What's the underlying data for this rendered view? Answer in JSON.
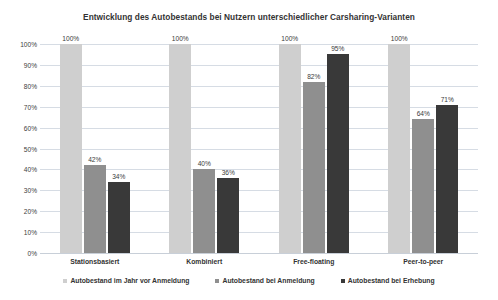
{
  "chart_data": {
    "type": "bar",
    "title": "Entwicklung des Autobestands bei Nutzern unterschiedlicher Carsharing-Varianten",
    "xlabel": "",
    "ylabel": "",
    "ylim": [
      0,
      100
    ],
    "grid": true,
    "legend_position": "bottom",
    "categories": [
      "Stationsbasiert",
      "Kombiniert",
      "Free-floating",
      "Peer-to-peer"
    ],
    "ytick_labels": [
      "100%",
      "90%",
      "80%",
      "70%",
      "60%",
      "50%",
      "40%",
      "30%",
      "20%",
      "10%",
      "0%"
    ],
    "ytick_values": [
      100,
      90,
      80,
      70,
      60,
      50,
      40,
      30,
      20,
      10,
      0
    ],
    "series": [
      {
        "name": "Autobestand im Jahr vor Anmeldung",
        "color": "#cfcfcf",
        "values": [
          100,
          100,
          100,
          100
        ],
        "labels": [
          "100%",
          "100%",
          "100%",
          "100%"
        ]
      },
      {
        "name": "Autobestand bei Anmeldung",
        "color": "#8f8f8f",
        "values": [
          42,
          40,
          82,
          64
        ],
        "labels": [
          "42%",
          "40%",
          "82%",
          "64%"
        ]
      },
      {
        "name": "Autobestand bei Erhebung",
        "color": "#393939",
        "values": [
          34,
          36,
          95,
          71
        ],
        "labels": [
          "34%",
          "36%",
          "95%",
          "71%"
        ]
      }
    ]
  }
}
